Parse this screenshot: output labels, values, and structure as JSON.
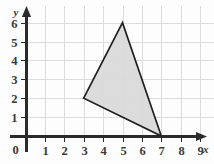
{
  "chart_data": {
    "type": "scatter",
    "title": "",
    "xlabel": "x",
    "ylabel": "y",
    "xlim": [
      0,
      9.6
    ],
    "ylim": [
      0,
      6.6
    ],
    "grid": true,
    "legend": null,
    "x_ticks": [
      "1",
      "2",
      "3",
      "4",
      "5",
      "6",
      "7",
      "8",
      "9"
    ],
    "x_tick_values": [
      1,
      2,
      3,
      4,
      5,
      6,
      7,
      8,
      9
    ],
    "y_ticks": [
      "1",
      "2",
      "3",
      "4",
      "5",
      "6"
    ],
    "y_tick_values": [
      1,
      2,
      3,
      4,
      5,
      6
    ],
    "origin_label": "0",
    "shapes": [
      {
        "name": "triangle",
        "kind": "polygon",
        "vertices": [
          [
            3,
            2
          ],
          [
            5,
            6
          ],
          [
            7,
            0
          ]
        ],
        "fill": "#d9d9d9",
        "stroke": "#1f1f1f"
      }
    ],
    "colors": {
      "grid": "#dcdcdc",
      "axis": "#2b2b2b",
      "shape_fill": "#d9d9d9",
      "shape_stroke": "#1f1f1f",
      "background": "#fdfdfd",
      "label": "#3a3a3a"
    }
  }
}
